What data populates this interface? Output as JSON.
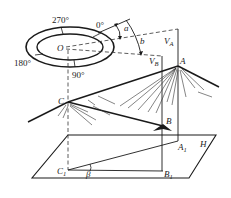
{
  "diagram": {
    "compass": {
      "center_label": "O",
      "angles": [
        "0°",
        "90°",
        "180°",
        "270°"
      ]
    },
    "angles": {
      "a": "a",
      "b": "b",
      "beta": "β"
    },
    "points": {
      "A": "A",
      "B": "B",
      "C": "C",
      "A1": "A",
      "A1_sub": "1",
      "B1": "B",
      "B1_sub": "1",
      "C1": "C",
      "C1_sub": "1"
    },
    "verticals": {
      "VA": "V",
      "VA_sub": "A",
      "VB": "V",
      "VB_sub": "B"
    },
    "plane_label": "H",
    "colors": {
      "line": "#1a1a1a",
      "dashed": "#333333",
      "background": "#ffffff"
    }
  }
}
